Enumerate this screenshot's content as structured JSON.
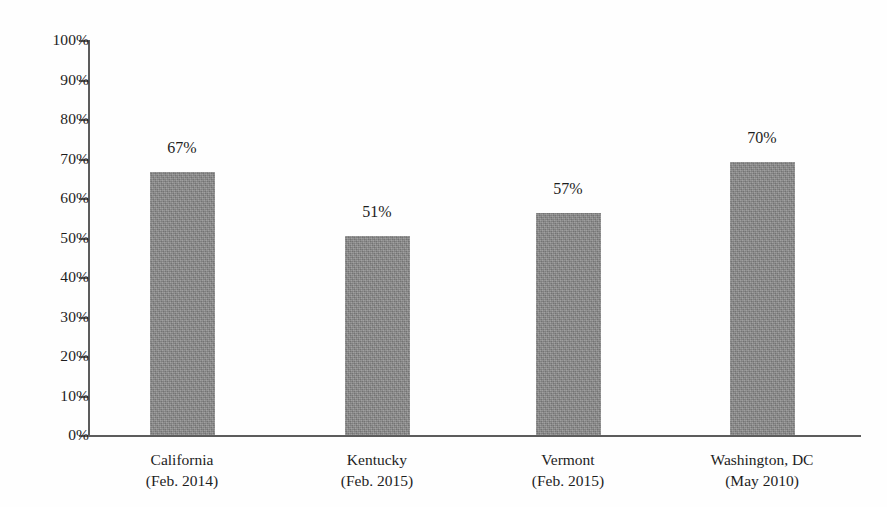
{
  "chart_data": {
    "type": "bar",
    "title": "",
    "subtitle": "",
    "xlabel": "",
    "ylabel": "",
    "categories": [
      "California",
      "Kentucky",
      "Vermont",
      "Washington, DC"
    ],
    "category_sublabels": [
      "(Feb. 2014)",
      "(Feb. 2015)",
      "(Feb. 2015)",
      "(May 2010)"
    ],
    "values": [
      67,
      51,
      57,
      70
    ],
    "value_labels": [
      "67%",
      "51%",
      "57%",
      "70%"
    ],
    "bar_top_percent": [
      66.5,
      50.5,
      56.2,
      69.0
    ],
    "ylim": [
      0,
      100
    ],
    "ytick_values": [
      0,
      10,
      20,
      30,
      40,
      50,
      60,
      70,
      80,
      90,
      100
    ],
    "ytick_labels": [
      "0%",
      "10%",
      "20%",
      "30%",
      "40%",
      "50%",
      "60%",
      "70%",
      "80%",
      "90%",
      "100%"
    ],
    "grid": false,
    "legend": null,
    "legend_position": "none",
    "series": [
      {
        "name": "Support",
        "values": [
          67,
          51,
          57,
          70
        ],
        "color": "#8a8a8a"
      }
    ],
    "colors": {
      "bar_fill": "#8a8a8a",
      "axis": "#5c5c5c",
      "text": "#1d1d1d",
      "background": "#fefefe"
    }
  }
}
